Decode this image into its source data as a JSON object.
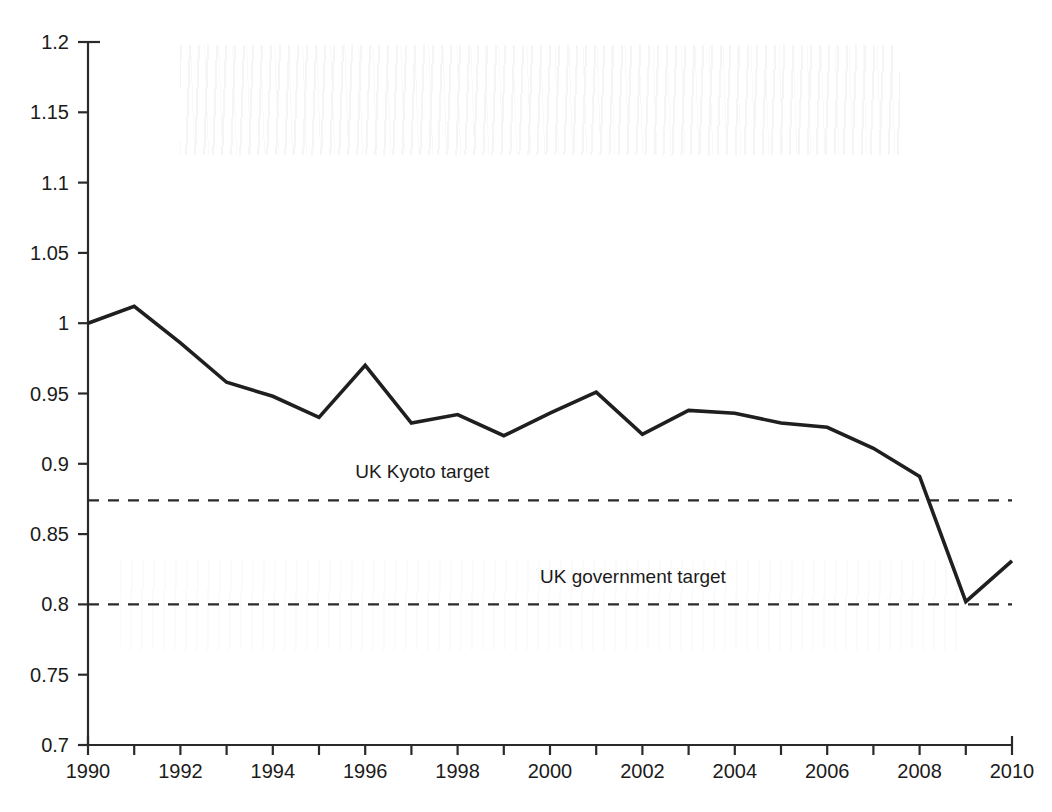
{
  "chart_data": {
    "type": "line",
    "title": "",
    "xlabel": "",
    "ylabel": "",
    "xlim": [
      1990,
      2010
    ],
    "ylim": [
      0.7,
      1.2
    ],
    "grid": false,
    "legend_position": "none",
    "x": [
      1990,
      1991,
      1992,
      1993,
      1994,
      1995,
      1996,
      1997,
      1998,
      1999,
      2000,
      2001,
      2002,
      2003,
      2004,
      2005,
      2006,
      2007,
      2008,
      2009,
      2010
    ],
    "series": [
      {
        "name": "UK greenhouse gas emissions (index, 1990 = 1)",
        "values": [
          1.0,
          1.012,
          0.986,
          0.958,
          0.948,
          0.933,
          0.97,
          0.929,
          0.935,
          0.92,
          0.936,
          0.951,
          0.921,
          0.938,
          0.936,
          0.929,
          0.926,
          0.911,
          0.891,
          0.802,
          0.831
        ]
      }
    ],
    "reference_lines": [
      {
        "label": "UK Kyoto target",
        "value": 0.874,
        "style": "dashed",
        "label_x": 1996,
        "label_y": 0.89
      },
      {
        "label": "UK government target",
        "value": 0.8,
        "style": "dashed",
        "label_x": 2000,
        "label_y": 0.815
      }
    ],
    "x_ticks": [
      1990,
      1991,
      1992,
      1993,
      1994,
      1995,
      1996,
      1997,
      1998,
      1999,
      2000,
      2001,
      2002,
      2003,
      2004,
      2005,
      2006,
      2007,
      2008,
      2009,
      2010
    ],
    "x_tick_labels": [
      "1990",
      "",
      "1992",
      "",
      "1994",
      "",
      "1996",
      "",
      "1998",
      "",
      "2000",
      "",
      "2002",
      "",
      "2004",
      "",
      "2006",
      "",
      "2008",
      "",
      "2010"
    ],
    "y_ticks": [
      0.7,
      0.75,
      0.8,
      0.85,
      0.9,
      0.95,
      1.0,
      1.05,
      1.1,
      1.15,
      1.2
    ],
    "y_tick_labels": [
      "0.7",
      "0.75",
      "0.8",
      "0.85",
      "0.9",
      "0.95",
      "1",
      "1.05",
      "1.1",
      "1.15",
      "1.2"
    ],
    "colors": {
      "series_line": "#1f1f1f",
      "axis": "#2a2a2a",
      "target_line": "#2a2a2a",
      "background": "#ffffff",
      "text": "#1b1b1b"
    }
  }
}
